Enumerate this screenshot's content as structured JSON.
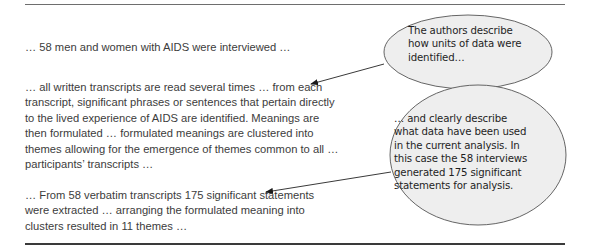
{
  "quotes": [
    {
      "lines": [
        "… 58 men and women with AIDS were interviewed  …"
      ]
    },
    {
      "lines": [
        "… all written transcripts are read several times … from each",
        "transcript, significant phrases or sentences that pertain directly",
        "to the lived experience of AIDS are identified. Meanings are",
        "then formulated … formulated meanings are clustered into",
        "themes allowing for the emergence of themes common to all …",
        "participants’ transcripts …"
      ]
    },
    {
      "lines": [
        "…  From 58 verbatim transcripts 175 significant statements",
        "were extracted … arranging the formulated meaning into",
        "clusters resulted in 11 themes …"
      ]
    }
  ],
  "callouts": [
    {
      "lines": [
        "The authors describe",
        "how units of data were",
        "identified…"
      ],
      "points_to": "quote 2"
    },
    {
      "lines": [
        "… and clearly describe",
        "what data have been used",
        "in the current analysis. In",
        "this case the 58 interviews",
        "generated 175 significant",
        "statements for analysis."
      ],
      "points_to": "quote 3"
    }
  ],
  "colors": {
    "body_text": "#3c3c3c",
    "callout_fill": "#eeeeee",
    "callout_stroke": "#555555",
    "rule": "#3a3a3a"
  }
}
